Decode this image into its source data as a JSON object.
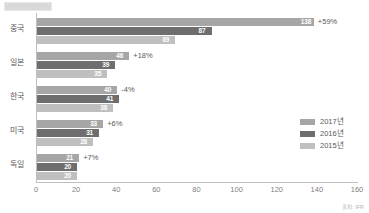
{
  "chart_data": {
    "type": "bar",
    "orientation": "horizontal",
    "title": "",
    "xlabel": "",
    "ylabel": "",
    "xlim": [
      0,
      160
    ],
    "xticks": [
      "0",
      "20",
      "40",
      "60",
      "80",
      "100",
      "120",
      "140",
      "160"
    ],
    "grid": false,
    "legend_position": "right",
    "categories": [
      "중국",
      "일본",
      "한국",
      "미국",
      "독일"
    ],
    "series": [
      {
        "name": "2017년",
        "color": "#a6a6a6",
        "values": [
          138,
          46,
          40,
          33,
          21
        ]
      },
      {
        "name": "2016년",
        "color": "#6e6e6e",
        "values": [
          87,
          39,
          41,
          31,
          20
        ]
      },
      {
        "name": "2015년",
        "color": "#bfbfbf",
        "values": [
          69,
          35,
          38,
          28,
          20
        ]
      }
    ],
    "annotations": [
      "+59%",
      "+18%",
      "-4%",
      "+6%",
      "+7%"
    ]
  },
  "legend": {
    "items": [
      {
        "label": "2017년",
        "color": "#a6a6a6"
      },
      {
        "label": "2016년",
        "color": "#6e6e6e"
      },
      {
        "label": "2015년",
        "color": "#bfbfbf"
      }
    ]
  },
  "source": {
    "text": "출처: IFR"
  },
  "colors": {
    "y2017": "#a6a6a6",
    "y2016": "#6e6e6e",
    "y2015": "#bfbfbf",
    "axis": "#bfbfbf",
    "text": "#595959"
  }
}
